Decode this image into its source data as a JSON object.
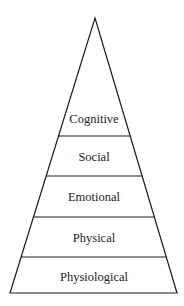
{
  "diagram": {
    "type": "pyramid",
    "levels_top_to_bottom": [
      {
        "label": "Cognitive"
      },
      {
        "label": "Social"
      },
      {
        "label": "Emotional"
      },
      {
        "label": "Physical"
      },
      {
        "label": "Physiological"
      }
    ],
    "colors": {
      "stroke": "#1a1a1a",
      "fill": "#ffffff",
      "text": "#222222"
    }
  }
}
